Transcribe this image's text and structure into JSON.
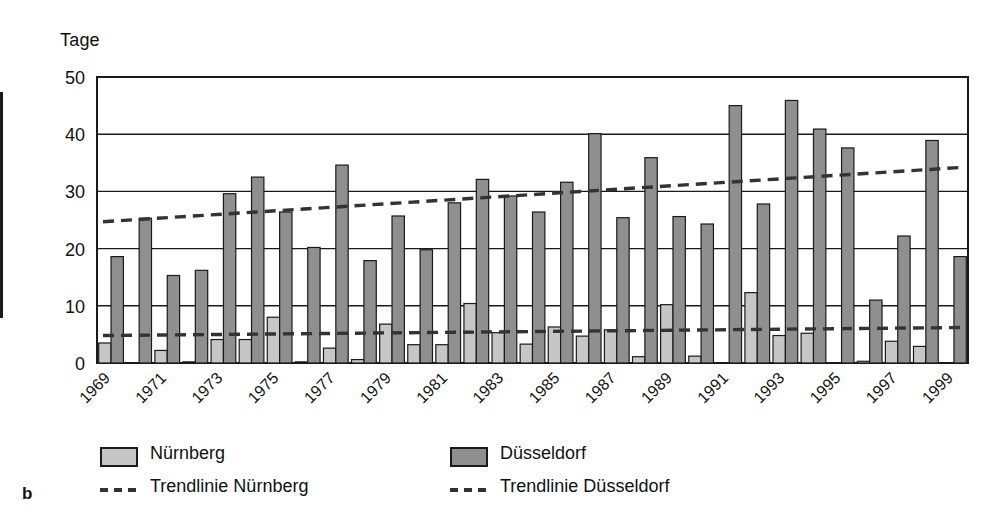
{
  "figure": {
    "panel_label": "b"
  },
  "axis": {
    "y_title": "Tage",
    "y_ticks": [
      "0",
      "10",
      "20",
      "30",
      "40",
      "50"
    ],
    "ylim": [
      0,
      50
    ]
  },
  "legend": {
    "items": [
      {
        "key": "nuernberg-bar",
        "label": "Nürnberg",
        "type": "swatch",
        "color": "#c6c6c6"
      },
      {
        "key": "duesseldorf-bar",
        "label": "Düsseldorf",
        "type": "swatch",
        "color": "#8f8f8f"
      },
      {
        "key": "nuernberg-trend",
        "label": "Trendlinie Nürnberg",
        "type": "dash",
        "color": "#333333"
      },
      {
        "key": "duesseldorf-trend",
        "label": "Trendlinie Düsseldorf",
        "type": "dash",
        "color": "#333333"
      }
    ]
  },
  "chart_data": {
    "type": "bar",
    "title": "",
    "xlabel": "",
    "ylabel": "Tage",
    "ylim": [
      0,
      50
    ],
    "grid": true,
    "legend_position": "bottom",
    "x": [
      1969,
      1970,
      1971,
      1972,
      1973,
      1974,
      1975,
      1976,
      1977,
      1978,
      1979,
      1980,
      1981,
      1982,
      1983,
      1984,
      1985,
      1986,
      1987,
      1988,
      1989,
      1990,
      1991,
      1992,
      1993,
      1994,
      1995,
      1996,
      1997,
      1998,
      1999
    ],
    "tick_labels": [
      "1969",
      "1971",
      "1973",
      "1975",
      "1977",
      "1979",
      "1981",
      "1983",
      "1985",
      "1987",
      "1989",
      "1991",
      "1993",
      "1995",
      "1997",
      "1999"
    ],
    "series": [
      {
        "name": "Nürnberg",
        "color": "#c6c6c6",
        "values": [
          3.5,
          0.0,
          2.2,
          0.2,
          4.1,
          4.1,
          8.0,
          0.2,
          2.6,
          0.6,
          6.8,
          3.2,
          3.2,
          10.4,
          5.3,
          3.3,
          6.3,
          4.7,
          5.8,
          1.1,
          10.2,
          1.2,
          0.0,
          12.3,
          4.8,
          5.2,
          0.0,
          0.3,
          3.8,
          2.9,
          0.0
        ]
      },
      {
        "name": "Düsseldorf",
        "color": "#8f8f8f",
        "values": [
          18.6,
          25.3,
          15.3,
          16.2,
          29.6,
          32.5,
          26.4,
          20.2,
          34.6,
          17.9,
          25.7,
          19.8,
          28.0,
          32.1,
          29.2,
          26.4,
          31.6,
          40.1,
          25.4,
          35.9,
          25.6,
          24.3,
          45.0,
          27.8,
          45.9,
          40.9,
          37.6,
          11.0,
          22.2,
          38.9,
          18.6
        ]
      }
    ],
    "trendlines": [
      {
        "name": "Trendlinie Nürnberg",
        "y_start": 4.8,
        "y_end": 6.2,
        "color": "#333333",
        "style": "dashed"
      },
      {
        "name": "Trendlinie Düsseldorf",
        "y_start": 24.7,
        "y_end": 34.2,
        "color": "#333333",
        "style": "dashed"
      }
    ]
  }
}
